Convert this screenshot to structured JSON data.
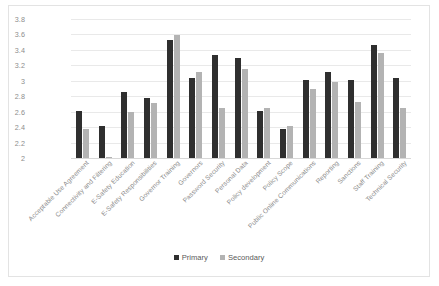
{
  "chart_data": {
    "type": "bar",
    "title": "",
    "subtitle": "",
    "xlabel": "",
    "ylabel": "",
    "ylim": [
      2,
      3.8
    ],
    "ytick_step": 0.2,
    "yticks": [
      "3.8",
      "3.6",
      "3.4",
      "3.2",
      "3",
      "2.8",
      "2.6",
      "2.4",
      "2.2",
      "2"
    ],
    "grid": true,
    "legend_position": "bottom-center",
    "categories": [
      "Acceptable Use Agreement",
      "Connectivity and Filtering",
      "E-Safety Education",
      "E-Safety Responsibilities",
      "Governor Training",
      "Governors",
      "Password Security",
      "Personal Data",
      "Policy development",
      "Policy Scope",
      "Public Online Communications",
      "Reporting",
      "Sanctions",
      "Staff Training",
      "Technical Security"
    ],
    "series": [
      {
        "name": "Primary",
        "color": "#2f2f2f",
        "values": [
          2.61,
          2.42,
          2.85,
          2.78,
          3.53,
          3.04,
          3.33,
          3.3,
          2.61,
          2.37,
          3.01,
          3.11,
          3.01,
          3.46,
          3.04
        ]
      },
      {
        "name": "Secondary",
        "color": "#b3b3b3",
        "values": [
          2.37,
          2.01,
          2.6,
          2.71,
          3.59,
          3.11,
          2.65,
          3.15,
          2.65,
          2.42,
          2.9,
          2.98,
          2.73,
          3.36,
          2.65
        ]
      }
    ]
  },
  "legend": {
    "items": [
      {
        "label": "Primary",
        "color": "#2f2f2f"
      },
      {
        "label": "Secondary",
        "color": "#b3b3b3"
      }
    ]
  }
}
